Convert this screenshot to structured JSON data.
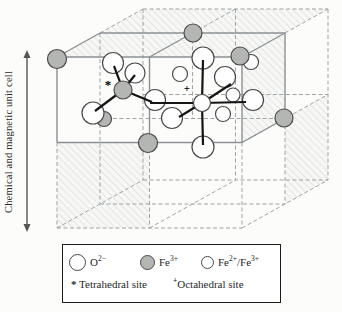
{
  "figure": {
    "unit_cell_label": "Chemical and magnetic unit cell"
  },
  "colors": {
    "background": "#fcfcfa",
    "line_solid": "#8b9094",
    "line_dashed": "#a0a4a6",
    "hatch": "#d9dcda",
    "bond": "#141414",
    "atom_stroke": "#4a4a4a",
    "fe3_fill": "#b4b6b4",
    "o_fill": "#ffffff",
    "arrow": "#555555",
    "legend_border": "#1c1c1c",
    "text": "#1f1f1f"
  },
  "legend": {
    "ions": [
      {
        "name": "oxygen-ion",
        "base": "O",
        "sup": "2−"
      },
      {
        "name": "fe3-ion",
        "base": "Fe",
        "sup": "3+"
      },
      {
        "name": "fe2-fe3-ion",
        "base": "Fe",
        "sup": "2+",
        "sep": "/",
        "base2": "Fe",
        "sup2": "3+"
      }
    ],
    "sites": [
      {
        "marker": "*",
        "label": "Tetrahedral site"
      },
      {
        "marker": "+",
        "label": "Octahedral site"
      }
    ]
  },
  "scene": {
    "hatch_faces": [
      [
        [
          57,
          57
        ],
        [
          100,
          33
        ],
        [
          285,
          33
        ],
        [
          242,
          57
        ]
      ],
      [
        [
          242,
          57
        ],
        [
          285,
          33
        ],
        [
          285,
          118.5
        ],
        [
          242,
          142.5
        ]
      ],
      [
        [
          100,
          33
        ],
        [
          143,
          9
        ],
        [
          328,
          9
        ],
        [
          285,
          33
        ]
      ],
      [
        [
          57,
          142.5
        ],
        [
          149.5,
          142.5
        ],
        [
          149.5,
          228
        ],
        [
          57,
          228
        ]
      ],
      [
        [
          285,
          118.5
        ],
        [
          328,
          94.5
        ],
        [
          328,
          180
        ],
        [
          285,
          204
        ]
      ]
    ],
    "dashed_lines": [
      [
        143,
        9,
        328,
        9
      ],
      [
        328,
        9,
        328,
        180
      ],
      [
        143,
        9,
        143,
        180
      ],
      [
        143,
        180,
        328,
        180
      ],
      [
        57,
        228,
        242,
        228
      ],
      [
        57,
        142.5,
        57,
        228
      ],
      [
        242,
        142.5,
        242,
        228
      ],
      [
        57,
        228,
        143,
        180
      ],
      [
        242,
        228,
        328,
        180
      ],
      [
        100,
        33,
        143,
        9
      ],
      [
        285,
        33,
        328,
        9
      ],
      [
        235.5,
        9,
        235.5,
        180
      ],
      [
        143,
        94.5,
        328,
        94.5
      ],
      [
        100,
        33,
        100,
        204
      ],
      [
        285,
        118.5,
        285,
        204
      ],
      [
        100,
        204,
        285,
        204
      ],
      [
        149.5,
        142.5,
        149.5,
        228
      ],
      [
        149.5,
        228,
        235.5,
        180
      ],
      [
        242,
        142.5,
        328,
        94.5
      ],
      [
        192.5,
        33,
        235.5,
        9
      ],
      [
        192.5,
        33,
        192.5,
        118.5
      ],
      [
        100,
        118.5,
        285,
        118.5
      ]
    ],
    "solid_lines": [
      [
        57,
        57,
        242,
        57
      ],
      [
        57,
        142.5,
        242,
        142.5
      ],
      [
        57,
        57,
        57,
        142.5
      ],
      [
        242,
        57,
        242,
        142.5
      ],
      [
        149.5,
        57,
        149.5,
        142.5
      ],
      [
        100,
        33,
        285,
        33
      ],
      [
        285,
        33,
        285,
        118.5
      ],
      [
        57,
        57,
        100,
        33
      ],
      [
        149.5,
        57,
        192.5,
        33
      ],
      [
        242,
        57,
        285,
        33
      ],
      [
        242,
        142.5,
        285,
        118.5
      ]
    ],
    "atoms": [
      {
        "k": "O",
        "x": 113,
        "y": 63,
        "r": 10.5
      },
      {
        "k": "O",
        "x": 135,
        "y": 73,
        "r": 10
      },
      {
        "k": "Fe3",
        "x": 104,
        "y": 119,
        "r": 7.5
      },
      {
        "k": "O",
        "x": 93,
        "y": 113,
        "r": 11
      },
      {
        "k": "O",
        "x": 155,
        "y": 100,
        "r": 10.5
      },
      {
        "k": "O",
        "x": 203,
        "y": 58,
        "r": 11
      },
      {
        "k": "Fe23",
        "x": 180,
        "y": 74,
        "r": 7.5
      },
      {
        "k": "Fe23",
        "x": 251,
        "y": 62,
        "r": 7.5
      },
      {
        "k": "O",
        "x": 225,
        "y": 77,
        "r": 10.5
      },
      {
        "k": "Fe23",
        "x": 233,
        "y": 95,
        "r": 7
      },
      {
        "k": "O",
        "x": 253,
        "y": 100,
        "r": 10.5
      },
      {
        "k": "Fe23",
        "x": 223,
        "y": 114,
        "r": 7.5
      },
      {
        "k": "O",
        "x": 172,
        "y": 118,
        "r": 10.5
      },
      {
        "k": "O",
        "x": 203,
        "y": 147,
        "r": 11
      },
      {
        "k": "Fe3",
        "x": 57,
        "y": 59,
        "r": 9.5
      },
      {
        "k": "Fe3",
        "x": 193,
        "y": 33,
        "r": 9
      },
      {
        "k": "Fe3",
        "x": 240,
        "y": 56,
        "r": 9
      },
      {
        "k": "Fe3",
        "x": 284,
        "y": 118,
        "r": 9
      },
      {
        "k": "Fe3",
        "x": 148,
        "y": 143,
        "r": 9.5
      }
    ],
    "bonds": [
      [
        123,
        90,
        114,
        66
      ],
      [
        123,
        90,
        95,
        111
      ],
      [
        123,
        90,
        152,
        102
      ],
      [
        123,
        90,
        135,
        75
      ],
      [
        202,
        103,
        203,
        60
      ],
      [
        202,
        103,
        203,
        145
      ],
      [
        202,
        103,
        150,
        103
      ],
      [
        202,
        103,
        246,
        102
      ],
      [
        202,
        103,
        231,
        84
      ],
      [
        202,
        103,
        179,
        117
      ]
    ],
    "sites": [
      {
        "k": "Fe3",
        "x": 123,
        "y": 90,
        "r": 9,
        "type": "tetrahedral-site-atom"
      },
      {
        "k": "O",
        "x": 202,
        "y": 103,
        "r": 8.5,
        "type": "octahedral-site-atom"
      }
    ],
    "site_markers": [
      {
        "t": "*",
        "x": 108,
        "y": 89,
        "size": 13
      },
      {
        "t": "+",
        "x": 187,
        "y": 92,
        "size": 11
      }
    ],
    "arrow": {
      "x": 27,
      "y1": 52,
      "y2": 230
    }
  }
}
